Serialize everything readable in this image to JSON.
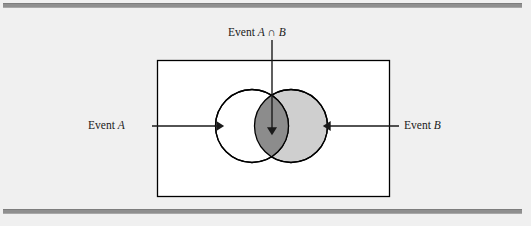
{
  "figure": {
    "type": "venn-diagram",
    "colors": {
      "page_background": "#f0f0f0",
      "sample_space_fill": "#ffffff",
      "sample_space_stroke": "#000000",
      "event_a_fill": "#ffffff",
      "event_b_fill": "#cfcfcf",
      "intersection_fill": "#8c8c8c",
      "circle_stroke": "#000000",
      "arrow_color": "#1a1a1a",
      "rule_color": "#8f8f8f",
      "text_color": "#1a1a1a"
    },
    "labels": {
      "intersection": {
        "prefix": "Event ",
        "set_a": "A",
        "operator": " ∩ ",
        "set_b": "B",
        "full_text": "Event A ∩ B"
      },
      "event_a": {
        "prefix": "Event ",
        "set": "A",
        "full_text": "Event A"
      },
      "event_b": {
        "prefix": "Event ",
        "set": "B",
        "full_text": "Event B"
      }
    },
    "geometry": {
      "sample_space_rect": {
        "x": 157,
        "y": 60,
        "width": 232,
        "height": 136
      },
      "circle_a": {
        "cx": 252,
        "cy": 126,
        "r": 36.5
      },
      "circle_b": {
        "cx": 291,
        "cy": 126,
        "r": 36.5
      },
      "arrow_intersection": {
        "x": 272,
        "y1": 40,
        "y2": 130
      },
      "arrow_a": {
        "y": 126,
        "x1": 152,
        "x2": 219
      },
      "arrow_b": {
        "y": 126,
        "x1": 399,
        "x2": 327
      }
    },
    "rules": {
      "top": {
        "x": 3,
        "y": 3,
        "width": 519,
        "height": 3
      },
      "bottom": {
        "x": 3,
        "y": 209,
        "width": 519,
        "height": 3
      }
    }
  }
}
